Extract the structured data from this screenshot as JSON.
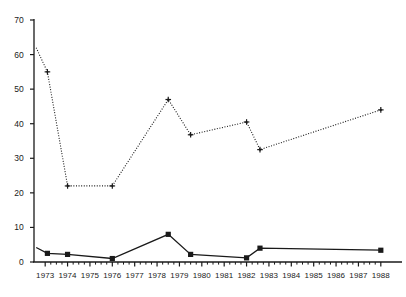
{
  "chart_data": {
    "type": "line",
    "title": "",
    "subtitle": "",
    "xlabel": "",
    "ylabel": "",
    "xlim": [
      1972.5,
      1988.5
    ],
    "ylim": [
      0,
      70
    ],
    "grid": false,
    "legend": "none",
    "yticks": [
      0,
      10,
      20,
      30,
      40,
      50,
      60,
      70
    ],
    "xticks": [
      1973,
      1974,
      1975,
      1976,
      1977,
      1978,
      1979,
      1980,
      1981,
      1982,
      1983,
      1984,
      1985,
      1986,
      1987,
      1988
    ],
    "xtick_labels": [
      "1973",
      "1974",
      "1975",
      "1976",
      "1977",
      "1978",
      "1979",
      "1980",
      "1981",
      "1982",
      "1983",
      "1984",
      "1985",
      "1986",
      "1987",
      "1988"
    ],
    "ytick_labels": [
      "0",
      "10",
      "20",
      "30",
      "40",
      "50",
      "60",
      "70"
    ],
    "minor_xticks": true,
    "series": [
      {
        "name": "upper-series",
        "style": "dotted",
        "marker": "plus",
        "color": "#1a1a1a",
        "x": [
          1972.6,
          1973.1,
          1974.0,
          1976.0,
          1978.5,
          1979.5,
          1982.0,
          1982.6,
          1988.0
        ],
        "values": [
          62.0,
          55.0,
          22.0,
          22.0,
          47.0,
          36.8,
          40.5,
          32.5,
          44.0
        ]
      },
      {
        "name": "lower-series",
        "style": "solid",
        "marker": "square",
        "color": "#1a1a1a",
        "x": [
          1972.6,
          1973.1,
          1974.0,
          1976.0,
          1978.5,
          1979.5,
          1982.0,
          1982.6,
          1988.0
        ],
        "values": [
          4.2,
          2.5,
          2.2,
          1.0,
          8.0,
          2.2,
          1.2,
          4.0,
          3.4
        ]
      }
    ]
  },
  "axes": {
    "axis_color": "#1a1a1a",
    "background": "#ffffff"
  }
}
